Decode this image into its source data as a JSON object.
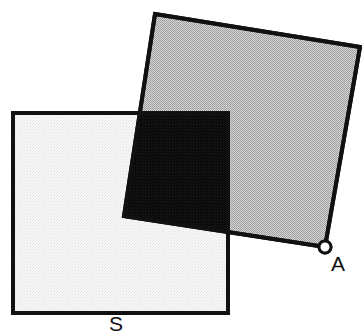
{
  "figure": {
    "background_color": "#ffffff",
    "width": 362,
    "height": 334,
    "stroke_color": "#111111",
    "stroke_width": 4
  },
  "shapes": {
    "light_square": {
      "name": "square-s",
      "label": "S",
      "fill_color": "#f2f2f2",
      "stroke_color": "#111111",
      "rotation_degrees": 0,
      "points": "13,113 228,113 228,313 13,313",
      "corners": [
        {
          "x": 13,
          "y": 113
        },
        {
          "x": 228,
          "y": 113
        },
        {
          "x": 228,
          "y": 313
        },
        {
          "x": 13,
          "y": 313
        }
      ]
    },
    "gray_square": {
      "name": "square-a",
      "label": "A",
      "fill_color": "#bcbcbc",
      "stroke_color": "#111111",
      "rotation_degrees": 9,
      "points": "155,14 360,47 325,247 124,216",
      "corners": [
        {
          "x": 155,
          "y": 14
        },
        {
          "x": 360,
          "y": 47
        },
        {
          "x": 325,
          "y": 247
        },
        {
          "x": 124,
          "y": 216
        }
      ]
    },
    "intersection": {
      "name": "overlap-region",
      "fill_color": "#0d0d0d",
      "points": "140,113 228,113 228,229 124,213"
    }
  },
  "markers": {
    "vertex_a": {
      "name": "vertex-marker-a",
      "cx": 325,
      "cy": 247,
      "r": 6,
      "fill_color": "#ffffff",
      "stroke_color": "#111111",
      "stroke_width": 3
    }
  },
  "labels": {
    "label_a": {
      "text": "A",
      "x": 331,
      "y": 271,
      "anchor": "start"
    },
    "label_s": {
      "text": "S",
      "x": 116,
      "y": 331,
      "anchor": "middle"
    }
  }
}
